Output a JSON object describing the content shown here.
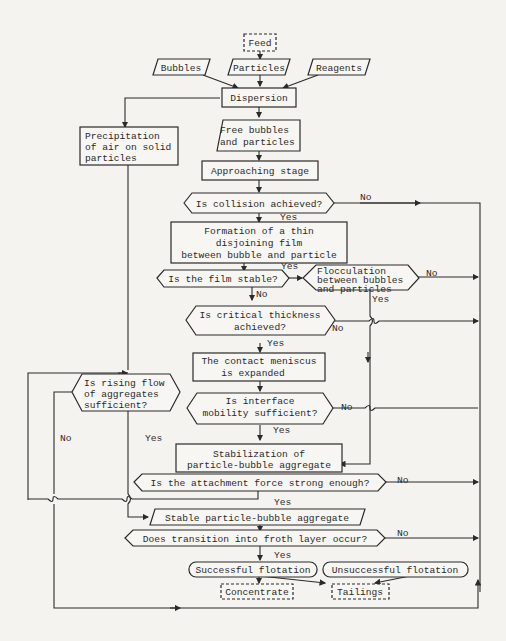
{
  "diagram": {
    "type": "flowchart",
    "nodes": {
      "feed": {
        "label": "Feed",
        "shape": "dashed-rect"
      },
      "bubbles": {
        "label": "Bubbles",
        "shape": "parallelogram"
      },
      "particles": {
        "label": "Particles",
        "shape": "parallelogram"
      },
      "reagents": {
        "label": "Reagents",
        "shape": "parallelogram"
      },
      "dispersion": {
        "label": "Dispersion",
        "shape": "rect"
      },
      "precipitation": {
        "lines": [
          "Precipitation",
          "of air on solid",
          "particles"
        ],
        "shape": "rect"
      },
      "free_bubbles": {
        "lines": [
          "Free bubbles",
          "and particles"
        ],
        "shape": "parallelogram"
      },
      "approaching": {
        "label": "Approaching stage",
        "shape": "rect"
      },
      "collision": {
        "label": "Is collision achieved?",
        "shape": "hexagon"
      },
      "film_formation": {
        "lines": [
          "Formation of a thin",
          "disjoining film",
          "between bubble and particle"
        ],
        "shape": "rect"
      },
      "film_stable": {
        "label": "Is the film stable?",
        "shape": "hexagon"
      },
      "flocculation": {
        "lines": [
          "Flocculation",
          "between bubbles",
          "and particles"
        ],
        "shape": "hexagon"
      },
      "critical_thickness": {
        "lines": [
          "Is critical thickness",
          "achieved?"
        ],
        "shape": "hexagon"
      },
      "meniscus": {
        "lines": [
          "The contact meniscus",
          "is expanded"
        ],
        "shape": "rect"
      },
      "rising_flow": {
        "lines": [
          "Is rising flow",
          "of aggregates",
          "sufficient?"
        ],
        "shape": "hexagon"
      },
      "interface_mobility": {
        "lines": [
          "Is interface",
          "mobility sufficient?"
        ],
        "shape": "hexagon"
      },
      "stabilization": {
        "lines": [
          "Stabilization of",
          "particle-bubble aggregate"
        ],
        "shape": "rect"
      },
      "attachment_force": {
        "label": "Is the attachment force strong enough?",
        "shape": "hexagon"
      },
      "stable_aggregate": {
        "label": "Stable particle-bubble aggregate",
        "shape": "parallelogram"
      },
      "froth_transition": {
        "label": "Does transition into  froth layer occur?",
        "shape": "hexagon"
      },
      "successful": {
        "label": "Successful flotation",
        "shape": "rounded"
      },
      "unsuccessful": {
        "label": "Unsuccessful flotation",
        "shape": "rounded"
      },
      "concentrate": {
        "label": "Concentrate",
        "shape": "dashed-rect"
      },
      "tailings": {
        "label": "Tailings",
        "shape": "dashed-rect"
      }
    },
    "edge_labels": {
      "yes": "Yes",
      "no": "No"
    },
    "edges": [
      {
        "from": "feed",
        "to": "particles"
      },
      {
        "from": "bubbles",
        "to": "dispersion"
      },
      {
        "from": "particles",
        "to": "dispersion"
      },
      {
        "from": "reagents",
        "to": "dispersion"
      },
      {
        "from": "dispersion",
        "to": "free_bubbles"
      },
      {
        "from": "dispersion",
        "to": "precipitation"
      },
      {
        "from": "free_bubbles",
        "to": "approaching"
      },
      {
        "from": "approaching",
        "to": "collision"
      },
      {
        "from": "collision",
        "to": "film_formation",
        "label": "Yes"
      },
      {
        "from": "collision",
        "to": "unsuccessful",
        "label": "No"
      },
      {
        "from": "film_formation",
        "to": "film_stable"
      },
      {
        "from": "film_stable",
        "to": "flocculation",
        "label": "Yes"
      },
      {
        "from": "film_stable",
        "to": "critical_thickness",
        "label": "No"
      },
      {
        "from": "flocculation",
        "to": "unsuccessful",
        "label": "No"
      },
      {
        "from": "flocculation",
        "to": "stabilization",
        "label": "Yes"
      },
      {
        "from": "critical_thickness",
        "to": "meniscus",
        "label": "Yes"
      },
      {
        "from": "critical_thickness",
        "to": "unsuccessful",
        "label": "No"
      },
      {
        "from": "meniscus",
        "to": "interface_mobility"
      },
      {
        "from": "interface_mobility",
        "to": "stabilization",
        "label": "Yes"
      },
      {
        "from": "interface_mobility",
        "to": "unsuccessful",
        "label": "No"
      },
      {
        "from": "precipitation",
        "to": "rising_flow"
      },
      {
        "from": "rising_flow",
        "to": "stable_aggregate",
        "label": "Yes"
      },
      {
        "from": "rising_flow",
        "to": "tailings",
        "label": "No"
      },
      {
        "from": "stabilization",
        "to": "attachment_force"
      },
      {
        "from": "attachment_force",
        "to": "stable_aggregate",
        "label": "Yes"
      },
      {
        "from": "attachment_force",
        "to": "rising_flow",
        "note": "Yes branch loop back"
      },
      {
        "from": "attachment_force",
        "to": "unsuccessful",
        "label": "No"
      },
      {
        "from": "stable_aggregate",
        "to": "froth_transition"
      },
      {
        "from": "froth_transition",
        "to": "successful",
        "label": "Yes"
      },
      {
        "from": "froth_transition",
        "to": "unsuccessful",
        "label": "No"
      },
      {
        "from": "successful",
        "to": "concentrate"
      },
      {
        "from": "successful",
        "to": "tailings"
      },
      {
        "from": "unsuccessful",
        "to": "tailings"
      }
    ]
  }
}
